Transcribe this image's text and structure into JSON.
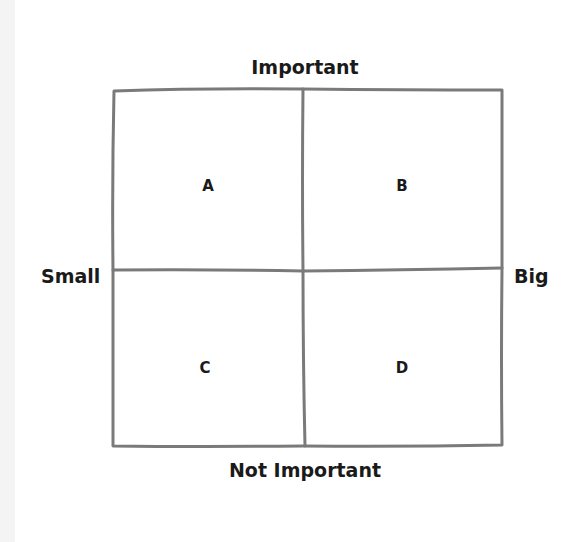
{
  "diagram": {
    "type": "2x2 matrix",
    "axes": {
      "top": "Important",
      "bottom": "Not Important",
      "left": "Small",
      "right": "Big"
    },
    "quadrants": [
      {
        "position": "top-left",
        "label": "A"
      },
      {
        "position": "top-right",
        "label": "B"
      },
      {
        "position": "bottom-left",
        "label": "C"
      },
      {
        "position": "bottom-right",
        "label": "D"
      }
    ],
    "colors": {
      "grid_line": "#7a7a7a",
      "text": "#1a1a1a",
      "background": "#ffffff"
    }
  }
}
